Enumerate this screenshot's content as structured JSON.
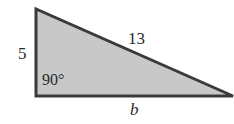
{
  "diagram": {
    "type": "right-triangle",
    "colors": {
      "fill": "#c8c8c8",
      "stroke": "#3a3a3a",
      "text": "#2a2a2a"
    },
    "vertices": {
      "top": [
        36,
        9
      ],
      "right_angle": [
        36,
        96
      ],
      "right": [
        233,
        96
      ]
    },
    "labels": {
      "vertical_leg": "5",
      "hypotenuse": "13",
      "angle": "90°",
      "base": "b"
    }
  }
}
